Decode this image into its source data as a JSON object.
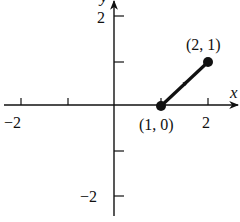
{
  "diagram": {
    "axes": {
      "x_label": "x",
      "y_label": "y",
      "x_ticks": [
        {
          "value": -2,
          "label": "−2"
        },
        {
          "value": -1,
          "label": ""
        },
        {
          "value": 1,
          "label": ""
        },
        {
          "value": 2,
          "label": "2"
        }
      ],
      "y_ticks": [
        {
          "value": 2,
          "label": "2"
        },
        {
          "value": 1,
          "label": ""
        },
        {
          "value": -1,
          "label": ""
        },
        {
          "value": -2,
          "label": "−2"
        }
      ]
    },
    "segment": {
      "start": {
        "x": 1,
        "y": 0,
        "label": "(1, 0)"
      },
      "end": {
        "x": 2,
        "y": 1,
        "label": "(2, 1)"
      },
      "direction": "start-to-end",
      "color": "#111111"
    },
    "labels": {
      "x_tick_neg2": "−2",
      "x_tick_2": "2",
      "y_tick_2": "2",
      "y_tick_neg2": "−2",
      "point_start": "(1, 0)",
      "point_end": "(2, 1)",
      "x_axis": "x",
      "y_axis": "y"
    }
  }
}
